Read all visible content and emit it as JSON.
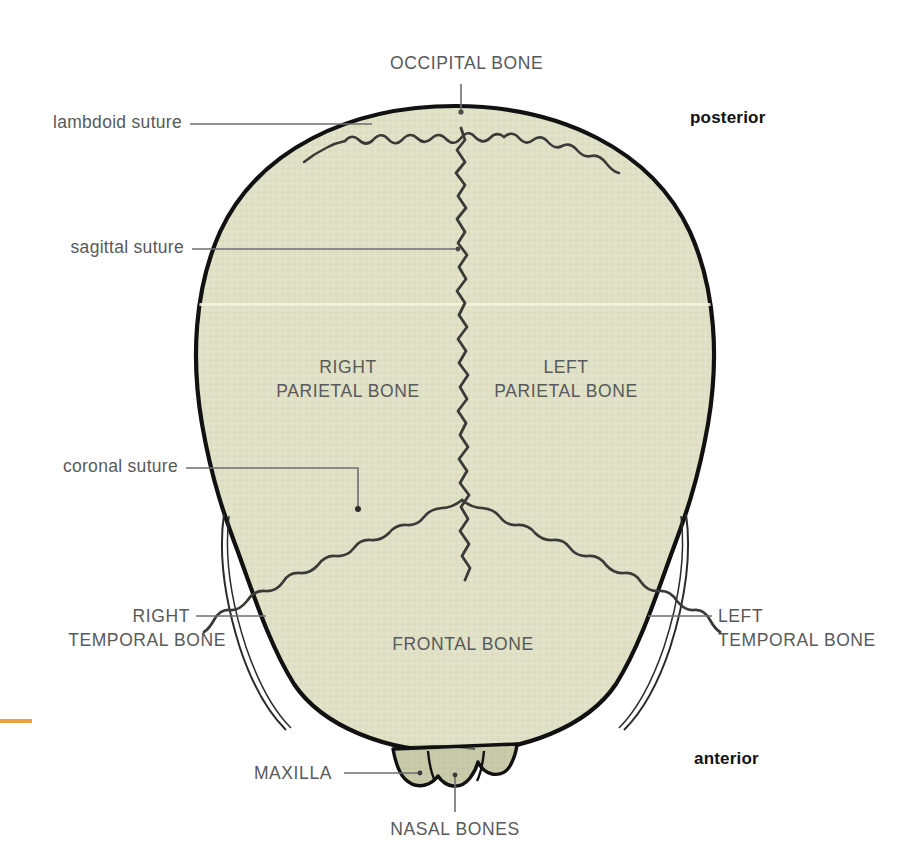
{
  "figure": {
    "colors": {
      "bone_fill": "#dfe0c5",
      "bone_fill_dark": "#c9cbab",
      "outline": "#111111",
      "suture": "#3a3a38",
      "leader": "#6d6e70",
      "label_text": "#58595b",
      "orientation_text": "#111111",
      "margin_mark": "#e8a33d",
      "scan_line": "#f2f2d8",
      "background": "#ffffff"
    }
  },
  "labels": {
    "occipital_bone": "OCCIPITAL BONE",
    "lambdoid_suture": "lambdoid suture",
    "sagittal_suture": "sagittal suture",
    "right_parietal_line1": "RIGHT",
    "right_parietal_line2": "PARIETAL BONE",
    "left_parietal_line1": "LEFT",
    "left_parietal_line2": "PARIETAL BONE",
    "coronal_suture": "coronal suture",
    "right_temporal_line1": "RIGHT",
    "right_temporal_line2": "TEMPORAL BONE",
    "left_temporal_line1": "LEFT",
    "left_temporal_line2": "TEMPORAL BONE",
    "frontal_bone": "FRONTAL BONE",
    "maxilla": "MAXILLA",
    "nasal_bones": "NASAL BONES"
  },
  "orientation": {
    "posterior": "posterior",
    "anterior": "anterior"
  }
}
